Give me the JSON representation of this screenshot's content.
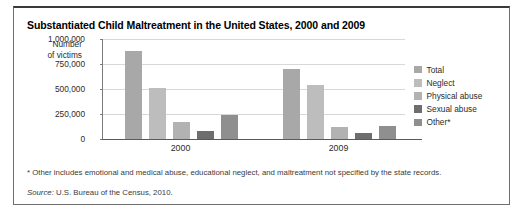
{
  "title": "Substantiated Child Maltreatment in the United States, 2000 and 2009",
  "axis_title_line1": "Number",
  "axis_title_line2": "of victims",
  "footnote": "* Other includes emotional and medical abuse, educational neglect, and maltreatment not specified by the state records.",
  "source_word": "Source:",
  "source_text": " U.S. Bureau of the Census, 2010.",
  "colors": {
    "total": "#a8a8a8",
    "neglect": "#bdbdbd",
    "physical_abuse": "#b2b2b2",
    "sexual_abuse": "#6e6e6e",
    "other": "#8f8f8f",
    "gridline": "#d8d8d8",
    "axis": "#7a7a7a",
    "frame": "#6f6f6f"
  },
  "legend": {
    "items": [
      {
        "label": "Total",
        "color": "#a8a8a8"
      },
      {
        "label": "Neglect",
        "color": "#bdbdbd"
      },
      {
        "label": "Physical abuse",
        "color": "#b2b2b2"
      },
      {
        "label": "Sexual abuse",
        "color": "#6e6e6e"
      },
      {
        "label": "Other*",
        "color": "#8f8f8f"
      }
    ]
  },
  "chart_data": {
    "type": "bar",
    "title": "Substantiated Child Maltreatment in the United States, 2000 and 2009",
    "xlabel": "",
    "ylabel": "Number of victims",
    "categories": [
      "2000",
      "2009"
    ],
    "ylim": [
      0,
      1000000
    ],
    "yticks": [
      0,
      250000,
      500000,
      750000,
      1000000
    ],
    "ytick_labels": [
      "0",
      "250,000",
      "500,000",
      "750,000",
      "1,000,000"
    ],
    "grid": true,
    "legend_position": "right",
    "series": [
      {
        "name": "Total",
        "color": "#a8a8a8",
        "values": [
          880000,
          700000
        ]
      },
      {
        "name": "Neglect",
        "color": "#bdbdbd",
        "values": [
          510000,
          540000
        ]
      },
      {
        "name": "Physical abuse",
        "color": "#b2b2b2",
        "values": [
          170000,
          120000
        ]
      },
      {
        "name": "Sexual abuse",
        "color": "#6e6e6e",
        "values": [
          85000,
          65000
        ]
      },
      {
        "name": "Other*",
        "color": "#8f8f8f",
        "values": [
          240000,
          135000
        ]
      }
    ]
  }
}
